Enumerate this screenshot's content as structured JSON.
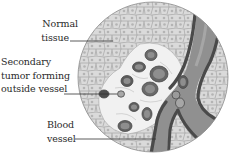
{
  "figure": {
    "labels": {
      "normal_tissue": [
        "Normal",
        "tissue"
      ],
      "secondary_tumor": [
        "Secondary",
        "tumor forming",
        "outside vessel"
      ],
      "blood_vessel": [
        "Blood",
        "vessel"
      ]
    },
    "colors": {
      "tissue_fill": "#d9d9d9",
      "cell_border": "#8a8a8a",
      "nucleus": "#b5b5b5",
      "clearing": "#f2f2f2",
      "tumor_cell": "#5f5f5f",
      "tumor_cell_inner": "#8c8c8c",
      "vessel_wall": "#4d4d4d",
      "vessel_lumen": "#8f8f8f",
      "leader_line": "#333333",
      "text": "#2a2a2a"
    }
  }
}
